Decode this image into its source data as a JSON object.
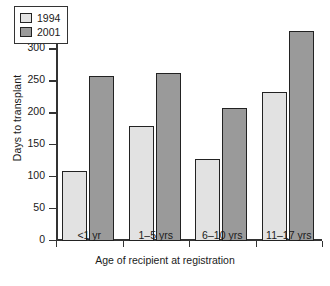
{
  "chart_data": {
    "type": "bar",
    "title": "",
    "xlabel": "Age of recipient at registration",
    "ylabel": "Days to transplant",
    "categories": [
      "<1 yr",
      "1–5 yrs",
      "6–10 yrs",
      "11–17 yrs"
    ],
    "series": [
      {
        "name": "1994",
        "values": [
          110,
          180,
          128,
          234
        ],
        "color": "#e2e2e2"
      },
      {
        "name": "2001",
        "values": [
          259,
          263,
          208,
          329
        ],
        "color": "#9a9a9a"
      }
    ],
    "ylim": [
      0,
      350
    ],
    "yticks": [
      0,
      50,
      100,
      150,
      200,
      250,
      300,
      350
    ],
    "ytick_labels": [
      "0",
      "50",
      "100",
      "150",
      "200",
      "250",
      "300",
      "350"
    ],
    "grid": false,
    "legend_position": "top-left-inside",
    "bar_edge_color": "#222222",
    "axis_color": "#333333",
    "background": "#ffffff"
  },
  "legend": {
    "entries": [
      {
        "label": "1994"
      },
      {
        "label": "2001"
      }
    ]
  }
}
